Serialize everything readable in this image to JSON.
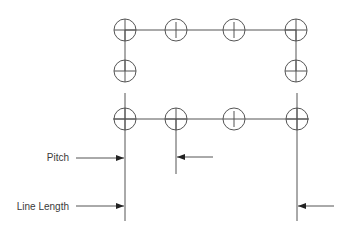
{
  "diagram": {
    "title": "",
    "labels": {
      "pitch": "Pitch",
      "line_length": "Line Length"
    },
    "colors": {
      "line": "#555555",
      "text": "#3a3a3a",
      "background": "#ffffff"
    },
    "circle_radius": 11,
    "top_row": [
      {
        "x": 125,
        "y": 30,
        "mark": "cross"
      },
      {
        "x": 176,
        "y": 30,
        "mark": "vertical"
      },
      {
        "x": 234,
        "y": 30,
        "mark": "vertical"
      },
      {
        "x": 296,
        "y": 30,
        "mark": "cross"
      }
    ],
    "middle_row": [
      {
        "x": 125,
        "y": 71,
        "mark": "cross"
      },
      {
        "x": 296,
        "y": 71,
        "mark": "cross"
      }
    ],
    "bottom_row": [
      {
        "x": 125,
        "y": 119,
        "mark": "cross"
      },
      {
        "x": 176,
        "y": 119,
        "mark": "vertical"
      },
      {
        "x": 234,
        "y": 119,
        "mark": "vertical"
      },
      {
        "x": 297,
        "y": 119,
        "mark": "cross"
      }
    ],
    "arrows": [
      {
        "name": "pitch-arrow-left",
        "from_x": 76,
        "to_x": 124,
        "y": 158
      },
      {
        "name": "pitch-arrow-right",
        "from_x": 213,
        "to_x": 177,
        "y": 157
      },
      {
        "name": "line-length-arrow-left",
        "from_x": 76,
        "to_x": 124,
        "y": 206
      },
      {
        "name": "line-length-arrow-right",
        "from_x": 334,
        "to_x": 298,
        "y": 206
      }
    ]
  }
}
